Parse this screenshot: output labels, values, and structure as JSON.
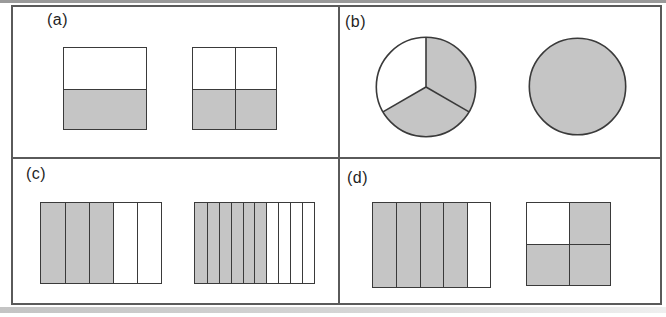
{
  "colors": {
    "shaded": "#c5c5c5",
    "unshaded": "#ffffff",
    "line": "#3a3a3a",
    "frame": "#5a5a5a",
    "label": "#1f1f1f",
    "page_background": "#ffffff"
  },
  "panels": [
    {
      "label": "(a)",
      "shapes": [
        {
          "name": "square-split-in-halves",
          "type": "grid",
          "rows": 2,
          "cols": 1,
          "total_parts": 2,
          "shaded_count": 1,
          "shaded_cells": [
            1
          ]
        },
        {
          "name": "square-split-in-quarters",
          "type": "grid",
          "rows": 2,
          "cols": 2,
          "total_parts": 4,
          "shaded_count": 2,
          "shaded_cells": [
            2,
            3
          ]
        }
      ]
    },
    {
      "label": "(b)",
      "shapes": [
        {
          "name": "circle-split-in-thirds",
          "type": "pie",
          "parts": 3,
          "shaded_parts": 2
        },
        {
          "name": "fully-shaded-circle",
          "type": "pie",
          "parts": 1,
          "shaded_parts": 1
        }
      ]
    },
    {
      "label": "(c)",
      "shapes": [
        {
          "name": "rectangle-split-in-fifths",
          "type": "grid",
          "rows": 1,
          "cols": 5,
          "total_parts": 5,
          "shaded_count": 3,
          "shaded_cells": [
            0,
            1,
            2
          ]
        },
        {
          "name": "rectangle-split-in-tenths",
          "type": "grid",
          "rows": 1,
          "cols": 10,
          "total_parts": 10,
          "shaded_count": 6,
          "shaded_cells": [
            0,
            1,
            2,
            3,
            4,
            5
          ]
        }
      ]
    },
    {
      "label": "(d)",
      "shapes": [
        {
          "name": "rectangle-split-in-fifths",
          "type": "grid",
          "rows": 1,
          "cols": 5,
          "total_parts": 5,
          "shaded_count": 4,
          "shaded_cells": [
            0,
            1,
            2,
            3
          ]
        },
        {
          "name": "square-split-in-quarters",
          "type": "grid",
          "rows": 2,
          "cols": 2,
          "total_parts": 4,
          "shaded_count": 3,
          "shaded_cells": [
            1,
            2,
            3
          ]
        }
      ]
    }
  ]
}
